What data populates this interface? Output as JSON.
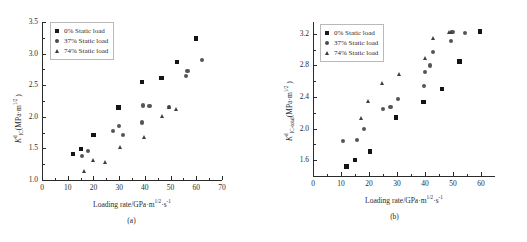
{
  "figure": {
    "panels": [
      {
        "caption": "(a)",
        "xlabel_prefix": "Loading rate/GPa·m",
        "xlabel_sup1": "1/2",
        "xlabel_mid": "·s",
        "xlabel_sup2": "-1",
        "ylabel_main": "K",
        "ylabel_sub": "IC",
        "ylabel_sup": "d",
        "ylabel_unit": "(MPa·m",
        "ylabel_unit_sup": "1/2",
        "ylabel_unit_end": " )",
        "legend": [
          {
            "label": "0% Static load",
            "marker": "square",
            "color": "#141414"
          },
          {
            "label": "37% Static load",
            "marker": "circle",
            "color": "#555555"
          },
          {
            "label": "74% Static load",
            "marker": "triangle",
            "color": "#3f3f3f"
          }
        ],
        "chart_data": {
          "type": "scatter",
          "title": "",
          "xlabel": "Loading rate/GPa·m^1/2·s^-1",
          "ylabel": "K_IC^d (MPa·m^1/2)",
          "xlim": [
            0,
            70
          ],
          "ylim": [
            1.0,
            3.5
          ],
          "xticks": [
            0,
            10,
            20,
            30,
            40,
            50,
            60,
            70
          ],
          "yticks": [
            1.0,
            1.5,
            2.0,
            2.5,
            3.0,
            3.5
          ],
          "grid": false,
          "legend_position": "upper-left",
          "series": [
            {
              "name": "0% Static load",
              "marker": "square",
              "points": [
                [
                  12.0,
                  1.41
                ],
                [
                  15.2,
                  1.49
                ],
                [
                  20.1,
                  1.71
                ],
                [
                  29.8,
                  2.15
                ],
                [
                  38.8,
                  2.55
                ],
                [
                  46.5,
                  2.61
                ],
                [
                  52.5,
                  2.87
                ],
                [
                  59.8,
                  3.24
                ]
              ]
            },
            {
              "name": "37% Static load",
              "marker": "circle",
              "points": [
                [
                  15.6,
                  1.38
                ],
                [
                  17.9,
                  1.46
                ],
                [
                  27.6,
                  1.78
                ],
                [
                  29.9,
                  1.86
                ],
                [
                  31.4,
                  1.71
                ],
                [
                  39.0,
                  1.91
                ],
                [
                  39.3,
                  2.18
                ],
                [
                  41.8,
                  2.17
                ],
                [
                  49.5,
                  2.15
                ],
                [
                  56.1,
                  2.65
                ],
                [
                  56.6,
                  2.73
                ],
                [
                  62.2,
                  2.9
                ]
              ]
            },
            {
              "name": "74% Static load",
              "marker": "triangle",
              "points": [
                [
                  16.8,
                  1.14
                ],
                [
                  20.3,
                  1.31
                ],
                [
                  24.8,
                  1.28
                ],
                [
                  30.7,
                  1.52
                ],
                [
                  40.0,
                  1.67
                ],
                [
                  46.8,
                  2.0
                ],
                [
                  49.6,
                  2.15
                ],
                [
                  52.4,
                  2.11
                ]
              ]
            }
          ]
        }
      },
      {
        "caption": "(b)",
        "xlabel_prefix": "Loading rate/GPa·m",
        "xlabel_sup1": "1/2",
        "xlabel_mid": "·s",
        "xlabel_sup2": "-1",
        "ylabel_main": "K",
        "ylabel_sub": "IC-total",
        "ylabel_sup": "d",
        "ylabel_unit": "(MPa·m",
        "ylabel_unit_sup": "1/2",
        "ylabel_unit_end": " )",
        "legend": [
          {
            "label": "0% Static load",
            "marker": "square",
            "color": "#141414"
          },
          {
            "label": "37% Static load",
            "marker": "circle",
            "color": "#555555"
          },
          {
            "label": "74% Static load",
            "marker": "triangle",
            "color": "#3f3f3f"
          }
        ],
        "chart_data": {
          "type": "scatter",
          "title": "",
          "xlabel": "Loading rate/GPa·m^1/2·s^-1",
          "ylabel": "K_IC-total^d (MPa·m^1/2)",
          "xlim": [
            0,
            65
          ],
          "ylim": [
            1.4,
            3.35
          ],
          "xticks": [
            0,
            10,
            20,
            30,
            40,
            50,
            60
          ],
          "yticks": [
            1.6,
            2.0,
            2.4,
            2.8,
            3.2
          ],
          "grid": false,
          "legend_position": "upper-left",
          "series": [
            {
              "name": "0% Static load",
              "marker": "square",
              "points": [
                [
                  11.9,
                  1.52
                ],
                [
                  15.1,
                  1.6
                ],
                [
                  20.3,
                  1.71
                ],
                [
                  29.7,
                  2.14
                ],
                [
                  39.4,
                  2.34
                ],
                [
                  46.1,
                  2.5
                ],
                [
                  52.3,
                  2.85
                ],
                [
                  59.6,
                  3.23
                ]
              ]
            },
            {
              "name": "37% Static load",
              "marker": "circle",
              "points": [
                [
                  10.8,
                  1.84
                ],
                [
                  15.6,
                  1.86
                ],
                [
                  18.2,
                  2.0
                ],
                [
                  25.0,
                  2.25
                ],
                [
                  27.7,
                  2.27
                ],
                [
                  30.4,
                  2.37
                ],
                [
                  39.6,
                  2.54
                ],
                [
                  40.1,
                  2.72
                ],
                [
                  41.9,
                  2.8
                ],
                [
                  42.8,
                  2.97
                ],
                [
                  49.3,
                  3.11
                ],
                [
                  49.8,
                  3.22
                ],
                [
                  54.3,
                  3.21
                ]
              ]
            },
            {
              "name": "74% Static load",
              "marker": "triangle",
              "points": [
                [
                  17.6,
                  2.13
                ],
                [
                  19.8,
                  2.34
                ],
                [
                  24.9,
                  2.57
                ],
                [
                  30.9,
                  2.69
                ],
                [
                  40.4,
                  2.89
                ],
                [
                  43.0,
                  3.14
                ],
                [
                  48.9,
                  3.22
                ],
                [
                  49.6,
                  3.22
                ]
              ]
            }
          ]
        }
      }
    ]
  }
}
